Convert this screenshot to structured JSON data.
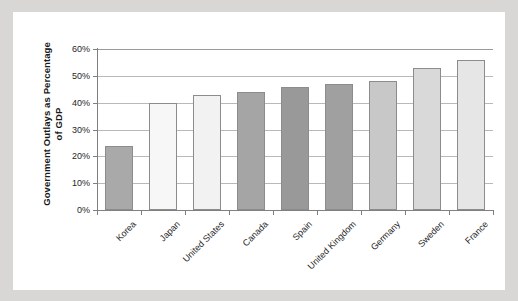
{
  "figure": {
    "background_color": "#ffffff",
    "page_background_color": "#d9d7d5",
    "axis_color": "#808080",
    "gridline_color": "#b9b9b9"
  },
  "chart_data": {
    "type": "bar",
    "title": "",
    "xlabel": "",
    "ylabel": "Government Outlays as Percentage of GDP",
    "ylim": [
      0,
      60
    ],
    "ytick_labels": [
      "0%",
      "10%",
      "20%",
      "30%",
      "40%",
      "50%",
      "60%"
    ],
    "ytick_values": [
      0,
      10,
      20,
      30,
      40,
      50,
      60
    ],
    "grid": true,
    "legend": "none",
    "units": "percent of GDP",
    "categories": [
      "Korea",
      "Japan",
      "United States",
      "Canada",
      "Spain",
      "United Kingdom",
      "Germany",
      "Sweden",
      "France"
    ],
    "values": [
      24,
      40,
      43,
      44,
      46,
      47,
      48,
      53,
      56
    ],
    "bar_colors": [
      "#a9a9a9",
      "#f7f7f7",
      "#f2f2f2",
      "#a5a5a5",
      "#999999",
      "#a0a0a0",
      "#c8c8c8",
      "#d9d9d9",
      "#e6e6e6"
    ],
    "bar_edge_color": "#8c8c8c"
  }
}
